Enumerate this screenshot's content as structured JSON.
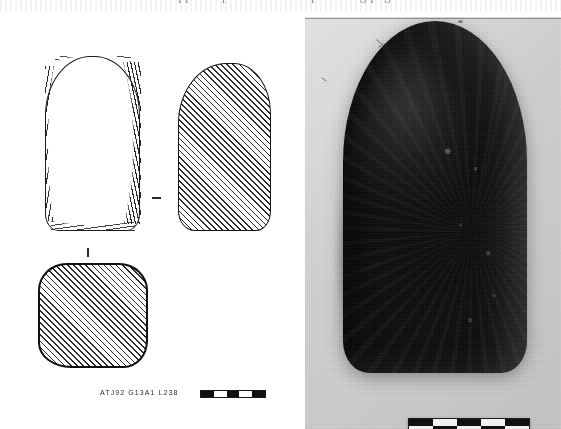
{
  "figure": {
    "type": "archaeological-illustration-plate",
    "background_color": "#ffffff"
  },
  "caption_strip": {
    "cutoff_text": "clipped caption line from preceding page",
    "visible": true
  },
  "drawing": {
    "panel_name": "line-drawing-panel",
    "views": [
      {
        "name": "front-view",
        "label": "front elevation",
        "style": "outline with edge comb-hatching"
      },
      {
        "name": "side-view",
        "label": "side elevation",
        "style": "full diagonal hatching"
      },
      {
        "name": "section-view",
        "label": "cross-section",
        "style": "full diagonal hatching"
      }
    ],
    "catalogue_label": "ATJ92 G13A1 L238",
    "scale_bar": {
      "name": "drawing-scale-bar",
      "segments": [
        "dark",
        "light",
        "dark",
        "light",
        "dark"
      ],
      "segment_count": 5
    },
    "ink_color": "#1a1a1a"
  },
  "photograph": {
    "panel_name": "photograph-panel",
    "subject": "dark ground-stone axe / adze head",
    "background_tone": "light grey studio board",
    "artefact_color": "#141414",
    "scale_bar": {
      "name": "photo-scale-bar",
      "pattern": "checkerboard",
      "rows": 2,
      "columns": 5,
      "top_row": [
        "dark",
        "light",
        "dark",
        "light",
        "dark"
      ],
      "bottom_row": [
        "light",
        "dark",
        "light",
        "dark",
        "light"
      ]
    }
  }
}
